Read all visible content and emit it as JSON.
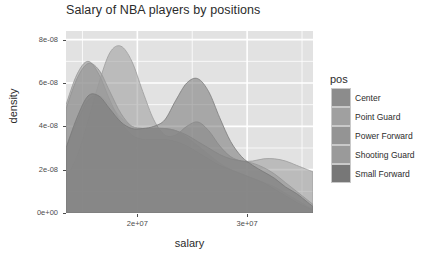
{
  "chart_data": {
    "type": "area",
    "title": "Salary of NBA players by positions",
    "xlabel": "salary",
    "ylabel": "density",
    "xlim": [
      13500000,
      36000000
    ],
    "ylim": [
      0,
      8.4e-08
    ],
    "grid": true,
    "legend_position": "right",
    "legend_title": "pos",
    "x_ticks": [
      {
        "value": 20000000,
        "label": "2e+07"
      },
      {
        "value": 30000000,
        "label": "3e+07"
      }
    ],
    "y_ticks": [
      {
        "value": 0,
        "label": "0e+00"
      },
      {
        "value": 2e-08,
        "label": "2e-08"
      },
      {
        "value": 4e-08,
        "label": "4e-08"
      },
      {
        "value": 6e-08,
        "label": "6e-08"
      },
      {
        "value": 8e-08,
        "label": "8e-08"
      }
    ],
    "series": [
      {
        "name": "Center",
        "color": "#8c8c8c",
        "x": [
          13500000,
          14500000,
          15500000,
          16500000,
          17500000,
          18500000,
          19500000,
          20500000,
          21500000,
          22500000,
          23500000,
          24500000,
          25500000,
          26500000,
          27500000,
          28500000,
          29500000,
          30500000,
          31500000,
          32500000,
          33500000,
          34500000,
          35500000,
          36000000
        ],
        "y": [
          4.8e-08,
          6.2e-08,
          6.9e-08,
          6.6e-08,
          5.6e-08,
          4.6e-08,
          4e-08,
          3.9e-08,
          3.9e-08,
          3.9e-08,
          3.8e-08,
          3.6e-08,
          3.3e-08,
          3e-08,
          2.7e-08,
          2.5e-08,
          2.4e-08,
          2.3e-08,
          2.1e-08,
          1.8e-08,
          1.4e-08,
          1e-08,
          6e-09,
          4e-09
        ]
      },
      {
        "name": "Point Guard",
        "color": "#a0a0a0",
        "x": [
          13500000,
          14500000,
          15500000,
          16500000,
          17500000,
          18500000,
          19500000,
          20500000,
          21500000,
          22500000,
          23500000,
          24500000,
          25500000,
          26500000,
          27500000,
          28500000,
          29500000,
          30500000,
          31500000,
          32500000,
          33500000,
          34500000,
          35500000,
          36000000
        ],
        "y": [
          3.1e-08,
          4.2e-08,
          5.2e-08,
          5.4e-08,
          5e-08,
          4.4e-08,
          4e-08,
          3.9e-08,
          3.9e-08,
          3.9e-08,
          3.8e-08,
          3.5e-08,
          3.1e-08,
          2.7e-08,
          2.3e-08,
          2e-08,
          1.8e-08,
          1.6e-08,
          1.4e-08,
          1.2e-08,
          9e-09,
          6e-09,
          3e-09,
          2e-09
        ]
      },
      {
        "name": "Power Forward",
        "color": "#949494",
        "x": [
          13500000,
          14500000,
          15500000,
          16500000,
          17500000,
          18500000,
          19500000,
          20500000,
          21500000,
          22500000,
          23500000,
          24500000,
          25500000,
          26500000,
          27500000,
          28500000,
          29500000,
          30500000,
          31500000,
          32500000,
          33500000,
          34500000,
          35500000,
          36000000
        ],
        "y": [
          5e-08,
          6.4e-08,
          7e-08,
          6.4e-08,
          5.2e-08,
          4.2e-08,
          3.6e-08,
          3.4e-08,
          3.4e-08,
          3.4e-08,
          3.3e-08,
          3.1e-08,
          2.8e-08,
          2.5e-08,
          2.2e-08,
          2e-08,
          1.8e-08,
          1.6e-08,
          1.4e-08,
          1.1e-08,
          8e-09,
          5e-09,
          2.5e-09,
          1.5e-09
        ]
      },
      {
        "name": "Shooting Guard",
        "color": "#9a9a9a",
        "x": [
          13500000,
          14500000,
          15500000,
          16500000,
          17500000,
          18500000,
          19500000,
          20500000,
          21500000,
          22500000,
          23500000,
          24500000,
          25500000,
          26500000,
          27500000,
          28500000,
          29500000,
          30500000,
          31500000,
          32500000,
          33500000,
          34500000,
          35500000,
          36000000
        ],
        "y": [
          1.6e-08,
          2.6e-08,
          4.2e-08,
          6e-08,
          7.4e-08,
          7.7e-08,
          7e-08,
          5.6e-08,
          4.3e-08,
          3.6e-08,
          3.6e-08,
          4e-08,
          4.2e-08,
          3.8e-08,
          3.1e-08,
          2.6e-08,
          2.4e-08,
          2.4e-08,
          2.5e-08,
          2.5e-08,
          2.4e-08,
          2.2e-08,
          2e-08,
          1.9e-08
        ]
      },
      {
        "name": "Small Forward",
        "color": "#777777",
        "x": [
          13500000,
          14500000,
          15500000,
          16500000,
          17500000,
          18500000,
          19500000,
          20500000,
          21500000,
          22500000,
          23500000,
          24500000,
          25500000,
          26500000,
          27500000,
          28500000,
          29500000,
          30500000,
          31500000,
          32500000,
          33500000,
          34500000,
          35500000,
          36000000
        ],
        "y": [
          3e-08,
          4.4e-08,
          5.4e-08,
          5.4e-08,
          4.8e-08,
          4.2e-08,
          3.9e-08,
          3.9e-08,
          4e-08,
          4.3e-08,
          5.2e-08,
          6e-08,
          6.2e-08,
          5.6e-08,
          4.4e-08,
          3.3e-08,
          2.6e-08,
          2.2e-08,
          1.9e-08,
          1.6e-08,
          1.2e-08,
          9e-09,
          5e-09,
          3e-09
        ]
      }
    ]
  },
  "legend": {
    "title": "pos",
    "items": [
      {
        "label": "Center",
        "color": "#8c8c8c"
      },
      {
        "label": "Point Guard",
        "color": "#a0a0a0"
      },
      {
        "label": "Power Forward",
        "color": "#949494"
      },
      {
        "label": "Shooting Guard",
        "color": "#9a9a9a"
      },
      {
        "label": "Small Forward",
        "color": "#777777"
      }
    ]
  },
  "theme": {
    "panel_background": "#e2e2e2",
    "grid_color": "#ffffff",
    "text_color": "#2b2b2b",
    "tick_color": "#4d4d4d"
  }
}
